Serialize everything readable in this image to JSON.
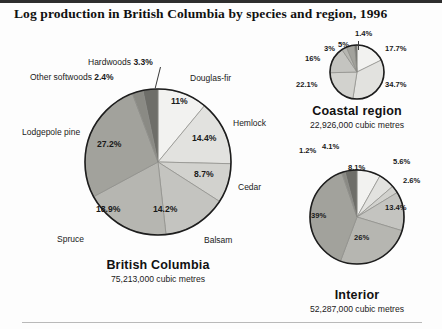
{
  "figure": {
    "title": "Log production in British Columbia by species and region, 1996"
  },
  "charts": {
    "british_columbia": {
      "name": "British Columbia",
      "volume": "75,213,000 cubic metres",
      "center": [
        158,
        162
      ],
      "radius": 73
    },
    "coastal": {
      "name": "Coastal region",
      "volume": "22,926,000 cubic metres",
      "center": [
        357,
        72
      ],
      "radius": 27
    },
    "interior": {
      "name": "Interior",
      "volume": "52,287,000 cubic metres",
      "center": [
        357,
        217
      ],
      "radius": 47
    }
  },
  "species_labels": {
    "douglas_fir": "Douglas-fir",
    "hemlock": "Hemlock",
    "cedar": "Cedar",
    "balsam": "Balsam",
    "spruce": "Spruce",
    "lodgepole_pine": "Lodgepole pine",
    "other_softwoods_name": "Other softwoods",
    "other_softwoods_pct": "2.4%",
    "hardwoods_name": "Hardwoods",
    "hardwoods_pct": "3.3%"
  },
  "bc_pct": {
    "douglas_fir": "11%",
    "hemlock": "14.4%",
    "cedar": "8.7%",
    "balsam": "14.2%",
    "spruce": "18.9%",
    "lodgepole_pine": "27.2%"
  },
  "coastal_pct": {
    "douglas_fir": "17.7%",
    "hemlock": "34.7%",
    "cedar": "22.1%",
    "balsam": "16%",
    "spruce": "3%",
    "lodgepole_pine": "5%",
    "hardwoods": "1.4%"
  },
  "interior_pct": {
    "douglas_fir": "8.1%",
    "hemlock": "5.6%",
    "cedar": "2.6%",
    "balsam": "13.4%",
    "spruce": "26%",
    "lodgepole_pine": "39%",
    "other_softwoods": "1.2%",
    "hardwoods": "4.1%"
  },
  "chart_data": [
    {
      "type": "pie",
      "title": "British Columbia",
      "subtitle": "75,213,000 cubic metres",
      "categories": [
        "Douglas-fir",
        "Hemlock",
        "Cedar",
        "Balsam",
        "Spruce",
        "Lodgepole pine",
        "Other softwoods",
        "Hardwoods"
      ],
      "values": [
        11.0,
        14.4,
        8.7,
        14.2,
        18.9,
        27.2,
        2.4,
        3.3
      ],
      "labels": [
        "11%",
        "14.4%",
        "8.7%",
        "14.2%",
        "18.9%",
        "27.2%",
        "2.4%",
        "3.3%"
      ],
      "colors": [
        "#f2f2f0",
        "#e2e2df",
        "#d2d2ce",
        "#c4c4c0",
        "#b6b6b1",
        "#a2a29c",
        "#8a8a84",
        "#6e6e69"
      ],
      "start_angle_deg": 0,
      "direction": "clockwise",
      "legend": "external-labels"
    },
    {
      "type": "pie",
      "title": "Coastal region",
      "subtitle": "22,926,000 cubic metres",
      "categories": [
        "Douglas-fir",
        "Hemlock",
        "Cedar",
        "Balsam",
        "Spruce",
        "Lodgepole pine",
        "Hardwoods"
      ],
      "values": [
        17.7,
        34.7,
        22.1,
        16.0,
        3.0,
        5.0,
        1.4
      ],
      "labels": [
        "17.7%",
        "34.7%",
        "22.1%",
        "16%",
        "3%",
        "5%",
        "1.4%"
      ],
      "colors": [
        "#f2f2f0",
        "#e2e2df",
        "#d2d2ce",
        "#c4c4c0",
        "#b6b6b1",
        "#a2a29c",
        "#6e6e69"
      ],
      "start_angle_deg": 0,
      "direction": "clockwise",
      "legend": "external-labels"
    },
    {
      "type": "pie",
      "title": "Interior",
      "subtitle": "52,287,000 cubic metres",
      "categories": [
        "Douglas-fir",
        "Hemlock",
        "Cedar",
        "Balsam",
        "Spruce",
        "Lodgepole pine",
        "Other softwoods",
        "Hardwoods"
      ],
      "values": [
        8.1,
        5.6,
        2.6,
        13.4,
        26.0,
        39.0,
        1.2,
        4.1
      ],
      "labels": [
        "8.1%",
        "5.6%",
        "2.6%",
        "13.4%",
        "26%",
        "39%",
        "1.2%",
        "4.1%"
      ],
      "colors": [
        "#f2f2f0",
        "#e2e2df",
        "#d2d2ce",
        "#c4c4c0",
        "#b6b6b1",
        "#a2a29c",
        "#8a8a84",
        "#6e6e69"
      ],
      "start_angle_deg": 0,
      "direction": "clockwise",
      "legend": "external-labels"
    }
  ]
}
